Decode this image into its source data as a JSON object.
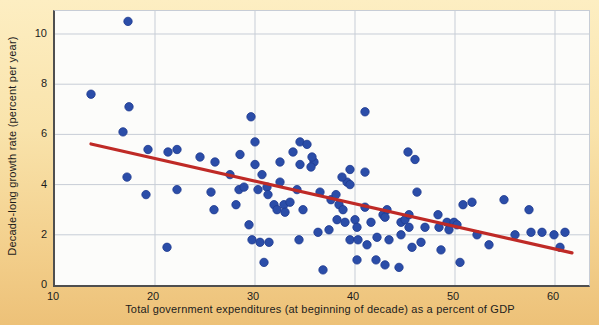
{
  "figure": {
    "y_axis_label": "Decade-long growth rate (percent per year)",
    "x_axis_label": "Total government expenditures (at beginning of decade) as a percent of GDP"
  },
  "chart_data": {
    "type": "scatter",
    "title": "",
    "xlabel": "Total government expenditures (at beginning of decade) as a percent of GDP",
    "ylabel": "Decade-long growth rate (percent per year)",
    "xlim": [
      10,
      63.4
    ],
    "ylim": [
      0,
      10.9
    ],
    "x_ticks": [
      10,
      20,
      30,
      40,
      50,
      60
    ],
    "y_ticks": [
      0,
      2,
      4,
      6,
      8,
      10
    ],
    "grid": true,
    "legend": "none",
    "point_color": "#2b4da8",
    "point_edge_color": "#1e3a8f",
    "grid_color": "#c7cdd6",
    "trendline_color": "#bf2a26",
    "trendline": {
      "x1": 13.6,
      "y1": 5.62,
      "x2": 61.7,
      "y2": 1.28
    },
    "points": [
      [
        13.6,
        7.6
      ],
      [
        17.3,
        10.5
      ],
      [
        17.4,
        7.1
      ],
      [
        16.8,
        6.1
      ],
      [
        19.3,
        5.4
      ],
      [
        21.3,
        5.3
      ],
      [
        22.2,
        5.4
      ],
      [
        24.5,
        5.1
      ],
      [
        26.0,
        4.9
      ],
      [
        17.2,
        4.3
      ],
      [
        19.1,
        3.6
      ],
      [
        22.2,
        3.8
      ],
      [
        25.6,
        3.7
      ],
      [
        25.9,
        3.0
      ],
      [
        21.2,
        1.5
      ],
      [
        27.5,
        4.4
      ],
      [
        28.5,
        5.2
      ],
      [
        29.6,
        6.7
      ],
      [
        30.0,
        5.7
      ],
      [
        34.5,
        5.7
      ],
      [
        35.2,
        5.6
      ],
      [
        33.8,
        5.3
      ],
      [
        30.0,
        4.8
      ],
      [
        32.5,
        4.9
      ],
      [
        35.9,
        4.9
      ],
      [
        35.7,
        5.1
      ],
      [
        30.7,
        4.4
      ],
      [
        32.5,
        4.1
      ],
      [
        34.5,
        4.8
      ],
      [
        35.6,
        4.7
      ],
      [
        28.4,
        3.8
      ],
      [
        28.9,
        3.9
      ],
      [
        30.3,
        3.8
      ],
      [
        31.2,
        3.9
      ],
      [
        28.1,
        3.2
      ],
      [
        31.9,
        3.2
      ],
      [
        32.2,
        3.0
      ],
      [
        32.9,
        3.2
      ],
      [
        33.0,
        2.9
      ],
      [
        34.8,
        3.0
      ],
      [
        31.3,
        3.6
      ],
      [
        33.5,
        3.3
      ],
      [
        34.2,
        3.8
      ],
      [
        36.5,
        3.7
      ],
      [
        37.6,
        3.4
      ],
      [
        38.4,
        3.2
      ],
      [
        38.1,
        3.6
      ],
      [
        39.2,
        4.1
      ],
      [
        39.5,
        4.0
      ],
      [
        39.5,
        4.6
      ],
      [
        41.0,
        4.5
      ],
      [
        38.7,
        4.3
      ],
      [
        41.0,
        6.9
      ],
      [
        45.3,
        5.3
      ],
      [
        46.0,
        5.0
      ],
      [
        41.0,
        3.1
      ],
      [
        38.8,
        3.0
      ],
      [
        38.2,
        2.6
      ],
      [
        39.0,
        2.5
      ],
      [
        40.0,
        2.6
      ],
      [
        40.2,
        2.3
      ],
      [
        41.6,
        2.5
      ],
      [
        42.8,
        2.8
      ],
      [
        43.2,
        3.0
      ],
      [
        43.0,
        2.7
      ],
      [
        44.6,
        2.5
      ],
      [
        45.0,
        2.6
      ],
      [
        45.4,
        2.8
      ],
      [
        45.4,
        2.3
      ],
      [
        36.3,
        2.1
      ],
      [
        37.4,
        2.2
      ],
      [
        39.5,
        1.8
      ],
      [
        40.3,
        1.8
      ],
      [
        41.2,
        1.6
      ],
      [
        42.2,
        1.9
      ],
      [
        43.4,
        1.8
      ],
      [
        44.6,
        2.0
      ],
      [
        30.9,
        0.9
      ],
      [
        36.8,
        0.6
      ],
      [
        40.2,
        1.0
      ],
      [
        42.1,
        1.0
      ],
      [
        43.0,
        0.8
      ],
      [
        44.4,
        0.7
      ],
      [
        50.5,
        0.9
      ],
      [
        29.7,
        1.8
      ],
      [
        30.5,
        1.7
      ],
      [
        31.4,
        1.7
      ],
      [
        34.4,
        1.8
      ],
      [
        29.4,
        2.4
      ],
      [
        46.2,
        3.7
      ],
      [
        47.0,
        2.3
      ],
      [
        46.6,
        1.7
      ],
      [
        45.7,
        1.5
      ],
      [
        48.3,
        2.8
      ],
      [
        48.4,
        2.3
      ],
      [
        49.2,
        2.5
      ],
      [
        49.4,
        2.2
      ],
      [
        48.6,
        1.4
      ],
      [
        49.9,
        2.5
      ],
      [
        50.2,
        2.4
      ],
      [
        50.8,
        3.2
      ],
      [
        51.7,
        3.3
      ],
      [
        52.2,
        2.0
      ],
      [
        53.4,
        1.6
      ],
      [
        54.9,
        3.4
      ],
      [
        56.0,
        2.0
      ],
      [
        57.4,
        3.0
      ],
      [
        57.6,
        2.1
      ],
      [
        58.7,
        2.1
      ],
      [
        59.9,
        2.0
      ],
      [
        61.0,
        2.1
      ],
      [
        60.5,
        1.5
      ]
    ]
  }
}
